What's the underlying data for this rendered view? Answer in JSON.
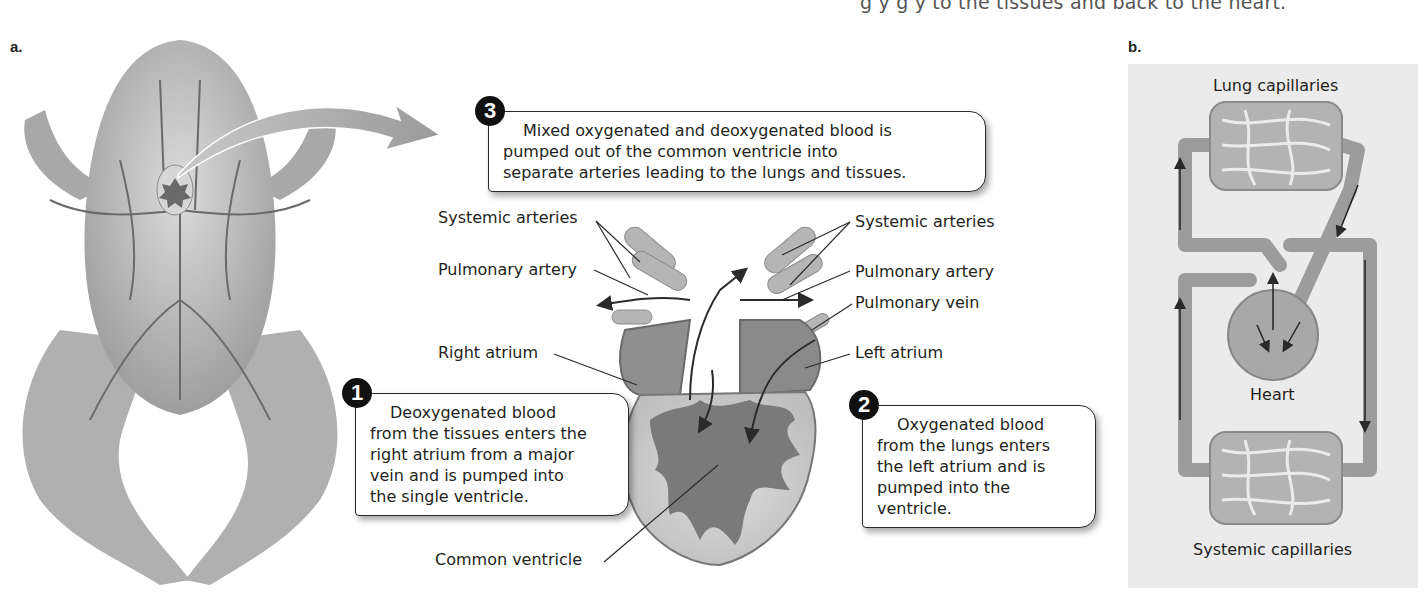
{
  "top_caption": "g    y g    y     to the tissues and back to the heart.",
  "panels": {
    "a": {
      "label": "a.",
      "callouts": [
        {
          "number": "1",
          "lines": [
            "Deoxygenated blood",
            "from the tissues enters the",
            "right atrium from a major",
            "vein and is pumped into",
            "the single ventricle."
          ]
        },
        {
          "number": "2",
          "lines": [
            "Oxygenated blood",
            "from the lungs enters",
            "the left atrium and is",
            "pumped into the",
            "ventricle."
          ]
        },
        {
          "number": "3",
          "lines": [
            "Mixed oxygenated and deoxygenated blood is",
            "pumped out of the common ventricle into",
            "separate arteries leading to the lungs and tissues."
          ]
        }
      ],
      "heart_labels": {
        "systemic_arteries_left": "Systemic  arteries",
        "pulmonary_artery_left": "Pulmonary artery",
        "right_atrium": "Right atrium",
        "common_ventricle": "Common ventricle",
        "systemic_arteries_right": "Systemic arteries",
        "pulmonary_artery_right": "Pulmonary artery",
        "pulmonary_vein": "Pulmonary vein",
        "left_atrium": "Left atrium"
      }
    },
    "b": {
      "label": "b.",
      "labels": {
        "lung_capillaries": "Lung capillaries",
        "heart": "Heart",
        "systemic_capillaries": "Systemic capillaries"
      }
    }
  },
  "colors": {
    "tissue_light": "#c9c9c9",
    "tissue_mid": "#9a9a9a",
    "tissue_dark": "#6e6e6e",
    "ink": "#231f20",
    "panel_b_bg": "#ebebeb"
  }
}
